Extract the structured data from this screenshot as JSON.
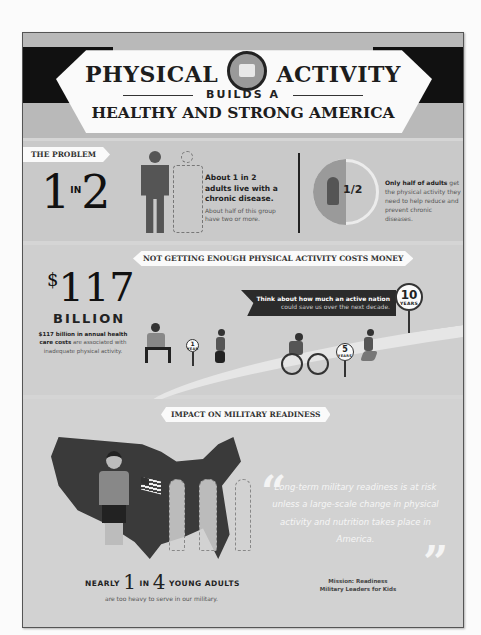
{
  "header": {
    "title_left": "PHYSICAL",
    "title_right": "ACTIVITY",
    "builds": "BUILDS A",
    "subtitle": "HEALTHY AND STRONG AMERICA",
    "logo_icon": "sunrise-emblem-icon"
  },
  "problem": {
    "tag": "THE PROBLEM",
    "ratio_left": "1",
    "ratio_in": "IN",
    "ratio_right": "2",
    "stat1_heading": "About 1 in 2 adults live with a chronic disease.",
    "stat1_sub": "About half of this group have two or more.",
    "half_label": "1/2",
    "stat2_bold": "Only half of adults",
    "stat2_rest": "get the physical activity they need to help reduce and prevent chronic diseases."
  },
  "money": {
    "tag": "NOT GETTING ENOUGH PHYSICAL ACTIVITY COSTS MONEY",
    "dollar": "$",
    "amount": "117",
    "unit": "BILLION",
    "desc_bold": "$117 billion in annual health care costs",
    "desc_rest": " are associated with inadequate physical activity.",
    "callout_bold": "Think about how much an active nation",
    "callout_rest": "could save us over the next decade.",
    "signs": [
      {
        "n": "1",
        "u": "YEAR"
      },
      {
        "n": "5",
        "u": "YEARS"
      },
      {
        "n": "10",
        "u": "YEARS"
      }
    ]
  },
  "military": {
    "tag": "IMPACT ON MILITARY READINESS",
    "nearly": "NEARLY",
    "n1": "1",
    "in": "IN",
    "n2": "4",
    "young_adults": "YOUNG ADULTS",
    "heavy": "are too heavy to serve in our military.",
    "quote": "Long-term military readiness is at risk unless a large-scale change in physical activity and nutrition takes place in America.",
    "open_quote": "“",
    "close_quote": "”",
    "attrib_line1": "Mission: Readiness",
    "attrib_line2": "Military Leaders for Kids"
  },
  "colors": {
    "frame_bg": "#d5d5d5",
    "header_bar": "#111111",
    "banner": "#fafafa",
    "text_dark": "#222222",
    "text_muted": "#555555"
  }
}
